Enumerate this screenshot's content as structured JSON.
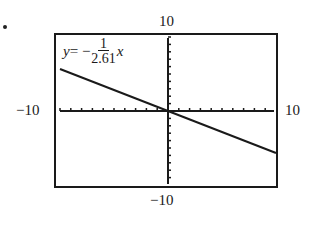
{
  "figure": {
    "bullet": "•",
    "equation": {
      "lhs": "y",
      "equals": " = −",
      "numerator": "1",
      "denominator": "2.61",
      "variable": "x"
    },
    "window_labels": {
      "ymax": "10",
      "ymin": "−10",
      "xmin": "−10",
      "xmax": "10"
    },
    "colors": {
      "line": "#1a1a1a",
      "frame": "#1a1a1a",
      "background": "#ffffff"
    }
  },
  "chart_data": {
    "type": "line",
    "xlabel": "",
    "ylabel": "",
    "xlim": [
      -10,
      10
    ],
    "ylim": [
      -10,
      10
    ],
    "xscale": 1,
    "yscale": 1,
    "grid": false,
    "legend": "none",
    "annotations": [
      "y = −1/2.61 x"
    ],
    "tick_labels": {
      "x": [
        "−10",
        "10"
      ],
      "y": [
        "−10",
        "10"
      ]
    },
    "series": [
      {
        "name": "y = −x/2.61",
        "slope": -0.3831,
        "intercept": 0,
        "x": [
          -10,
          -5,
          0,
          5,
          10
        ],
        "y": [
          3.83,
          1.92,
          0,
          -1.92,
          -3.83
        ]
      }
    ]
  }
}
